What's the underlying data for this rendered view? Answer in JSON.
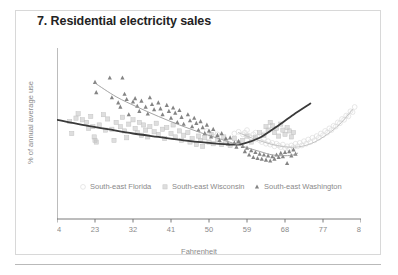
{
  "chart_data": {
    "type": "scatter",
    "title": "7. Residential electricity sales",
    "xlabel": "Fahrenheit",
    "ylabel": "% of annual average use",
    "xlim": [
      14,
      86
    ],
    "ylim": [
      0,
      200
    ],
    "xticks": [
      14,
      23,
      32,
      41,
      50,
      59,
      68,
      77,
      86
    ],
    "yticks": [
      0,
      50,
      100,
      150,
      200
    ],
    "grid": false,
    "legend_position": "inside-bottom",
    "series": [
      {
        "name": "South-east Florida",
        "marker": "circle",
        "color": "#dcdcdc",
        "points": [
          [
            58.5,
            101
          ],
          [
            59.5,
            97
          ],
          [
            60,
            95
          ],
          [
            60.5,
            99
          ],
          [
            61,
            93
          ],
          [
            61.5,
            96
          ],
          [
            62,
            92
          ],
          [
            62.5,
            90
          ],
          [
            63,
            94
          ],
          [
            63.5,
            88
          ],
          [
            64,
            91
          ],
          [
            64.5,
            87
          ],
          [
            65,
            89
          ],
          [
            65.5,
            85
          ],
          [
            66,
            88
          ],
          [
            66.5,
            86
          ],
          [
            67,
            84
          ],
          [
            67.5,
            87
          ],
          [
            68,
            83
          ],
          [
            68.5,
            85
          ],
          [
            69,
            82
          ],
          [
            69.5,
            86
          ],
          [
            70,
            84
          ],
          [
            70.5,
            88
          ],
          [
            71,
            85
          ],
          [
            71.5,
            89
          ],
          [
            72,
            86
          ],
          [
            72.5,
            91
          ],
          [
            73,
            88
          ],
          [
            73.5,
            93
          ],
          [
            74,
            90
          ],
          [
            74.5,
            95
          ],
          [
            75,
            92
          ],
          [
            75.5,
            97
          ],
          [
            76,
            95
          ],
          [
            76.5,
            100
          ],
          [
            77,
            98
          ],
          [
            77.5,
            103
          ],
          [
            78,
            101
          ],
          [
            78.5,
            106
          ],
          [
            79,
            104
          ],
          [
            79.5,
            109
          ],
          [
            80,
            108
          ],
          [
            80.5,
            113
          ],
          [
            81,
            112
          ],
          [
            81.5,
            117
          ],
          [
            82,
            116
          ],
          [
            82.5,
            121
          ],
          [
            83,
            120
          ],
          [
            83.5,
            126
          ],
          [
            84,
            125
          ],
          [
            84.5,
            131
          ],
          [
            49.5,
            103
          ],
          [
            51,
            101
          ],
          [
            52,
            99
          ],
          [
            56,
            100
          ],
          [
            57,
            102
          ],
          [
            58,
            99
          ],
          [
            59,
            104
          ],
          [
            61,
            101
          ],
          [
            63,
            99
          ]
        ],
        "trend": [
          [
            57,
            101
          ],
          [
            60,
            95
          ],
          [
            63,
            90
          ],
          [
            66,
            86
          ],
          [
            69,
            84
          ],
          [
            72,
            85
          ],
          [
            75,
            90
          ],
          [
            78,
            99
          ],
          [
            81,
            111
          ],
          [
            84,
            128
          ]
        ],
        "trend_color": "#bdbdbd"
      },
      {
        "name": "South-east Wisconsin",
        "marker": "square",
        "color": "#c3c3c3",
        "points": [
          [
            17,
            114
          ],
          [
            17.5,
            100
          ],
          [
            18.5,
            118
          ],
          [
            19,
            123
          ],
          [
            20,
            116
          ],
          [
            21,
            113
          ],
          [
            21.5,
            106
          ],
          [
            22,
            120
          ],
          [
            22.5,
            108
          ],
          [
            22.8,
            96
          ],
          [
            23,
            92
          ],
          [
            23.3,
            90
          ],
          [
            24,
            110
          ],
          [
            25,
            122
          ],
          [
            25.5,
            104
          ],
          [
            26,
            117
          ],
          [
            27,
            105
          ],
          [
            27.5,
            92
          ],
          [
            28,
            113
          ],
          [
            29,
            108
          ],
          [
            29.5,
            119
          ],
          [
            30,
            103
          ],
          [
            30.5,
            95
          ],
          [
            31,
            111
          ],
          [
            32,
            116
          ],
          [
            32.5,
            106
          ],
          [
            33,
            101
          ],
          [
            33.5,
            113
          ],
          [
            34,
            98
          ],
          [
            34.5,
            110
          ],
          [
            35,
            104
          ],
          [
            35.5,
            96
          ],
          [
            36,
            108
          ],
          [
            37,
            102
          ],
          [
            37.5,
            112
          ],
          [
            38,
            99
          ],
          [
            39,
            105
          ],
          [
            39.5,
            94
          ],
          [
            40,
            107
          ],
          [
            41,
            100
          ],
          [
            41.5,
            110
          ],
          [
            42,
            96
          ],
          [
            43,
            103
          ],
          [
            43.5,
            92
          ],
          [
            44,
            98
          ],
          [
            45,
            101
          ],
          [
            45.5,
            90
          ],
          [
            46,
            94
          ],
          [
            47,
            87
          ],
          [
            47.5,
            97
          ],
          [
            48,
            92
          ],
          [
            48.5,
            85
          ],
          [
            49,
            95
          ],
          [
            50,
            90
          ],
          [
            50.5,
            99
          ],
          [
            51,
            88
          ],
          [
            52,
            93
          ],
          [
            53,
            87
          ],
          [
            53.5,
            96
          ],
          [
            54,
            91
          ],
          [
            55,
            86
          ],
          [
            56,
            94
          ],
          [
            57,
            89
          ],
          [
            58,
            92
          ],
          [
            59,
            97
          ],
          [
            60,
            90
          ],
          [
            61,
            95
          ],
          [
            62,
            101
          ],
          [
            63,
            98
          ],
          [
            63.5,
            108
          ],
          [
            64,
            104
          ],
          [
            64.5,
            113
          ],
          [
            65,
            109
          ],
          [
            65.5,
            101
          ],
          [
            66,
            106
          ],
          [
            66.5,
            97
          ],
          [
            67,
            111
          ],
          [
            67.5,
            104
          ],
          [
            68,
            99
          ],
          [
            68.5,
            107
          ],
          [
            69,
            103
          ],
          [
            69.5,
            96
          ],
          [
            70,
            101
          ]
        ],
        "trend": [
          [
            14,
            116
          ],
          [
            20,
            110
          ],
          [
            26,
            105
          ],
          [
            32,
            100
          ],
          [
            38,
            96
          ],
          [
            44,
            92
          ],
          [
            50,
            89
          ],
          [
            55,
            87
          ],
          [
            58,
            88
          ],
          [
            62,
            95
          ],
          [
            66,
            108
          ],
          [
            70,
            122
          ],
          [
            74,
            135
          ]
        ],
        "trend_color": "#3a3a3a"
      },
      {
        "name": "South-east Washington",
        "marker": "triangle",
        "color": "#6e6e6e",
        "points": [
          [
            23,
            160
          ],
          [
            23.3,
            148
          ],
          [
            26.5,
            165
          ],
          [
            29.5,
            165
          ],
          [
            27,
            142
          ],
          [
            28.5,
            136
          ],
          [
            29,
            131
          ],
          [
            30,
            146
          ],
          [
            30.5,
            140
          ],
          [
            31,
            122
          ],
          [
            32,
            137
          ],
          [
            32.5,
            141
          ],
          [
            33,
            132
          ],
          [
            33.5,
            126
          ],
          [
            34,
            138
          ],
          [
            35,
            131
          ],
          [
            35.5,
            123
          ],
          [
            36,
            142
          ],
          [
            36.5,
            134
          ],
          [
            37,
            128
          ],
          [
            38,
            136
          ],
          [
            38.5,
            129
          ],
          [
            39,
            122
          ],
          [
            40,
            133
          ],
          [
            40.5,
            126
          ],
          [
            41,
            118
          ],
          [
            41.5,
            130
          ],
          [
            42,
            124
          ],
          [
            42.5,
            113
          ],
          [
            43,
            127
          ],
          [
            43.5,
            119
          ],
          [
            44,
            111
          ],
          [
            45,
            122
          ],
          [
            45.5,
            115
          ],
          [
            46,
            108
          ],
          [
            46.5,
            118
          ],
          [
            47,
            112
          ],
          [
            47.5,
            104
          ],
          [
            48,
            114
          ],
          [
            48.5,
            107
          ],
          [
            49,
            100
          ],
          [
            49.5,
            110
          ],
          [
            50,
            103
          ],
          [
            50.5,
            96
          ],
          [
            51,
            105
          ],
          [
            52,
            98
          ],
          [
            52.5,
            92
          ],
          [
            53,
            100
          ],
          [
            54,
            94
          ],
          [
            54.5,
            88
          ],
          [
            55,
            95
          ],
          [
            56,
            89
          ],
          [
            56.5,
            84
          ],
          [
            57,
            91
          ],
          [
            58,
            85
          ],
          [
            58.5,
            79
          ],
          [
            59,
            83
          ],
          [
            59.5,
            75
          ],
          [
            60,
            80
          ],
          [
            60.5,
            72
          ],
          [
            61,
            78
          ],
          [
            61.5,
            71
          ],
          [
            62,
            76
          ],
          [
            62.5,
            70
          ],
          [
            63,
            75
          ],
          [
            63.5,
            69
          ],
          [
            64,
            74
          ],
          [
            64.5,
            68
          ],
          [
            65,
            73
          ],
          [
            65.5,
            70
          ],
          [
            66,
            75
          ],
          [
            66.5,
            72
          ],
          [
            67,
            77
          ],
          [
            67.5,
            73
          ],
          [
            68,
            78
          ],
          [
            68.5,
            65
          ],
          [
            69,
            79
          ],
          [
            69.5,
            74
          ],
          [
            70,
            81
          ],
          [
            70.5,
            76
          ]
        ],
        "trend": [
          [
            23,
            159
          ],
          [
            28,
            143
          ],
          [
            33,
            131
          ],
          [
            38,
            120
          ],
          [
            43,
            110
          ],
          [
            48,
            101
          ],
          [
            53,
            93
          ],
          [
            58,
            85
          ],
          [
            62,
            79
          ],
          [
            65,
            75
          ],
          [
            68,
            74
          ],
          [
            70,
            75
          ],
          [
            71,
            77
          ]
        ],
        "trend_color": "#9a9a9a"
      }
    ]
  },
  "legend": {
    "items": [
      {
        "label": "South-east Florida",
        "marker": "circle"
      },
      {
        "label": "South-east Wisconsin",
        "marker": "square"
      },
      {
        "label": "South-east Washington",
        "marker": "triangle"
      }
    ]
  },
  "colors": {
    "title": "#232323",
    "axis": "#6b6b6b",
    "tick_text": "#8a8a8a",
    "frame": "#d8d8d8",
    "rule": "#b9b9b9"
  }
}
